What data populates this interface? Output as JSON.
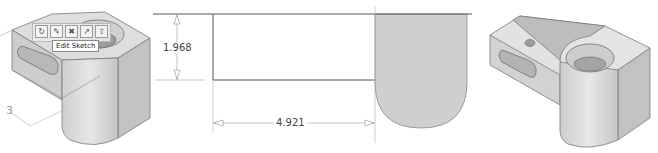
{
  "left_view": {
    "toolbar": {
      "buttons": [
        {
          "name": "rotate-icon",
          "glyph": "↻"
        },
        {
          "name": "edit-sketch-icon",
          "glyph": "✎"
        },
        {
          "name": "sketch-dim-icon",
          "glyph": "✖"
        },
        {
          "name": "feature-icon",
          "glyph": "↗"
        },
        {
          "name": "extrude-icon",
          "glyph": "⇧"
        }
      ]
    },
    "tooltip": "Edit Sketch",
    "dimension_label": "3"
  },
  "sketch_view": {
    "vertical_dimension": "1.968",
    "horizontal_dimension": "4.921"
  },
  "colors": {
    "part_fill": "#d4d4d4",
    "part_edge": "#7a7a7a",
    "sketch_line": "#555555",
    "shaded_region": "#cfcfcf",
    "dimension_line": "#8a8a8a"
  }
}
